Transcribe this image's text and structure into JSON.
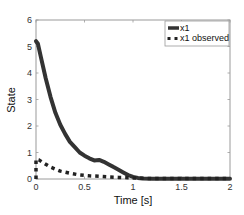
{
  "chart_data": {
    "type": "line",
    "title": "",
    "xlabel": "Time [s]",
    "ylabel": "State",
    "xlim": [
      0,
      2
    ],
    "ylim": [
      0,
      6
    ],
    "xticks": [
      0,
      0.5,
      1,
      1.5,
      2
    ],
    "xtick_labels": [
      "0",
      "0.5",
      "1",
      "1.5",
      "2"
    ],
    "yticks": [
      0,
      1,
      2,
      3,
      4,
      5,
      6
    ],
    "ytick_labels": [
      "0",
      "1",
      "2",
      "3",
      "4",
      "5",
      "6"
    ],
    "grid": false,
    "legend_position": "upper right",
    "series": [
      {
        "name": "x1",
        "style": "solid",
        "color": "#333333",
        "x": [
          0,
          0.02,
          0.05,
          0.1,
          0.15,
          0.2,
          0.25,
          0.3,
          0.35,
          0.4,
          0.45,
          0.5,
          0.55,
          0.6,
          0.65,
          0.7,
          0.75,
          0.8,
          0.85,
          0.9,
          0.95,
          1.0,
          1.05,
          1.1,
          1.2,
          1.4,
          1.6,
          1.8,
          2.0
        ],
        "y": [
          5.2,
          5.1,
          4.6,
          3.8,
          3.1,
          2.5,
          2.05,
          1.7,
          1.4,
          1.2,
          1.0,
          0.88,
          0.78,
          0.7,
          0.72,
          0.65,
          0.55,
          0.45,
          0.35,
          0.25,
          0.15,
          0.08,
          0.04,
          0.02,
          0.01,
          0.01,
          0.01,
          0.01,
          0.01
        ]
      },
      {
        "name": "x1 observed",
        "style": "dotted",
        "color": "#222222",
        "x": [
          0,
          0.0,
          0.0,
          0.03,
          0.08,
          0.15,
          0.25,
          0.35,
          0.45,
          0.55,
          0.65,
          0.75,
          0.85,
          0.95,
          1.05,
          1.2,
          1.4,
          1.6,
          1.8,
          2.0
        ],
        "y": [
          0.0,
          0.35,
          0.75,
          0.72,
          0.6,
          0.45,
          0.3,
          0.22,
          0.15,
          0.12,
          0.1,
          0.08,
          0.06,
          0.05,
          0.03,
          0.02,
          0.02,
          0.02,
          0.02,
          0.02
        ]
      }
    ]
  },
  "legend": {
    "items": [
      {
        "label": "x1"
      },
      {
        "label": "x1 observed"
      }
    ]
  }
}
